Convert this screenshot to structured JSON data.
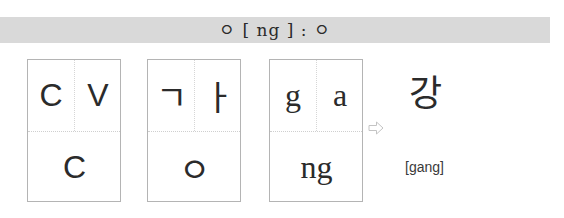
{
  "header": {
    "title": "ㅇ [ ng ] : ㅇ"
  },
  "boxes": [
    {
      "label": "structure",
      "top_left": "C",
      "top_right": "V",
      "bottom": "C"
    },
    {
      "label": "hangul-jamo",
      "top_left": "ㄱ",
      "top_right": "ㅏ",
      "bottom": "ㅇ"
    },
    {
      "label": "romanization",
      "top_left": "g",
      "top_right": "a",
      "bottom": "ng"
    }
  ],
  "arrow": {
    "icon": "right-arrow-icon",
    "glyph": "⇨"
  },
  "result": {
    "syllable": "강",
    "romanization": "[gang]"
  }
}
